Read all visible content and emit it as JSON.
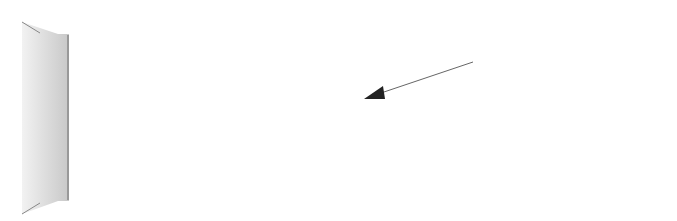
{
  "diagram": {
    "strings": [
      {
        "name": "Mi",
        "y": 35,
        "thick": false
      },
      {
        "name": "Si",
        "y": 68,
        "thick": false
      },
      {
        "name": "Sol",
        "y": 101,
        "thick": false
      },
      {
        "name": "Ré",
        "y": 134,
        "thick": true
      },
      {
        "name": "Lá",
        "y": 167,
        "thick": true
      },
      {
        "name": "Mi",
        "y": 200,
        "thick": true
      }
    ],
    "frets_x": [
      69,
      149,
      230,
      310,
      389
    ],
    "fretboard_right_x": 405,
    "fingers": [
      {
        "label": "1",
        "x": 189,
        "y": 167
      },
      {
        "label": "4",
        "x": 349,
        "y": 101
      },
      {
        "label": "3",
        "x": 349,
        "y": 134
      }
    ],
    "annotation": {
      "text": "Tônica Oitavada",
      "target_finger": "4"
    },
    "colors": {
      "nut_fill": "#d8d8d8",
      "string": "#555555",
      "thick_string": "#2a2a2a",
      "fret": "#777777"
    }
  }
}
